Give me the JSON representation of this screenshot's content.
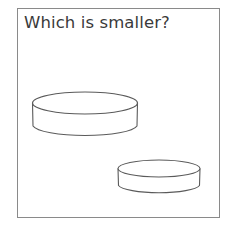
{
  "question": {
    "text": "Which is smaller?"
  },
  "colors": {
    "border": "#8a8a8a",
    "stroke": "#5a5a5a",
    "text": "#3a3a3a",
    "background": "#ffffff"
  },
  "shapes": [
    {
      "name": "large-cylinder",
      "type": "cylinder",
      "cx": 85,
      "top_cy": 103,
      "rx": 52.5,
      "ry": 11,
      "height": 23
    },
    {
      "name": "small-cylinder",
      "type": "cylinder",
      "cx": 159,
      "top_cy": 168.5,
      "rx": 41,
      "ry": 8.5,
      "height": 17
    }
  ]
}
